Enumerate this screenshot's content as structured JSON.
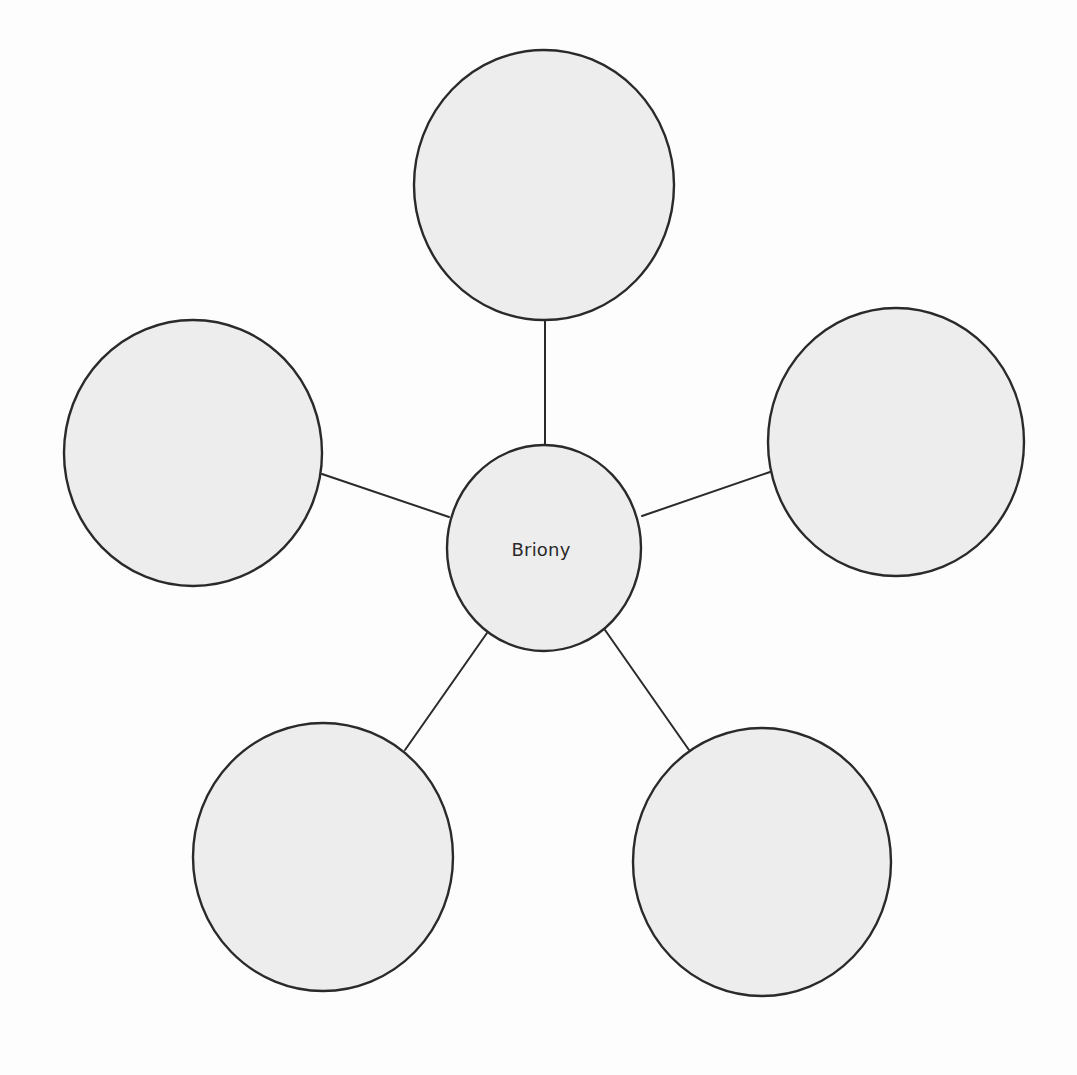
{
  "diagram": {
    "type": "spider-diagram",
    "colors": {
      "background": "#fdfdfd",
      "bubble_fill": "#ededed",
      "stroke": "#2a2a2a",
      "text": "#2a2a2a"
    },
    "center": {
      "label": "Briony",
      "cx": 544,
      "cy": 548,
      "rx": 97,
      "ry": 103
    },
    "nodes": [
      {
        "id": "top",
        "label": "",
        "cx": 544,
        "cy": 185,
        "rx": 130,
        "ry": 135
      },
      {
        "id": "left",
        "label": "",
        "cx": 193,
        "cy": 453,
        "rx": 129,
        "ry": 133
      },
      {
        "id": "right",
        "label": "",
        "cx": 896,
        "cy": 442,
        "rx": 128,
        "ry": 134
      },
      {
        "id": "bottom-left",
        "label": "",
        "cx": 323,
        "cy": 857,
        "rx": 130,
        "ry": 134
      },
      {
        "id": "bottom-right",
        "label": "",
        "cx": 762,
        "cy": 862,
        "rx": 129,
        "ry": 134
      }
    ],
    "connectors": [
      {
        "id": "top",
        "x1": 545,
        "y1": 320,
        "x2": 545,
        "y2": 445
      },
      {
        "id": "left",
        "x1": 322,
        "y1": 474,
        "x2": 449,
        "y2": 517
      },
      {
        "id": "right",
        "x1": 642,
        "y1": 516,
        "x2": 770,
        "y2": 472
      },
      {
        "id": "bottom-left",
        "x1": 487,
        "y1": 633,
        "x2": 405,
        "y2": 750
      },
      {
        "id": "bottom-right",
        "x1": 605,
        "y1": 630,
        "x2": 689,
        "y2": 750
      }
    ]
  }
}
